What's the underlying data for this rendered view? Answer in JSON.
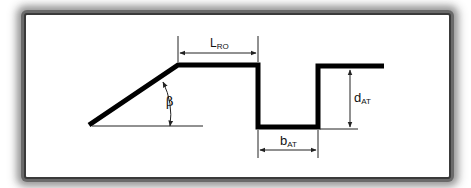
{
  "diagram": {
    "type": "cross-section profile",
    "labels": {
      "l_ro": {
        "main": "L",
        "sub": "RO"
      },
      "b_at": {
        "main": "b",
        "sub": "AT"
      },
      "d_at": {
        "main": "d",
        "sub": "AT"
      },
      "beta": "β"
    },
    "colors": {
      "profile": "#000000",
      "dimension": "#222222",
      "background": "#ffffff",
      "frame_shadow": "#6a6a6a"
    }
  }
}
